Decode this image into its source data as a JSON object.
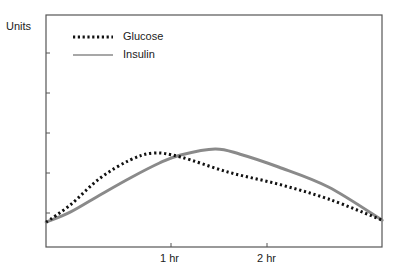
{
  "chart_data": {
    "type": "line",
    "title": "",
    "xlabel": "",
    "ylabel": "Units",
    "x_ticks": [
      {
        "label": "1 hr",
        "value": 1
      },
      {
        "label": "2 hr",
        "value": 2
      }
    ],
    "y_ticks_count": 5,
    "y_tick_labels": [],
    "xlim": [
      -0.3,
      3.2
    ],
    "ylim": [
      0,
      5.8
    ],
    "grid": false,
    "legend_position": "upper-left",
    "series": [
      {
        "name": "Glucose",
        "style": "dotted",
        "color": "#111111",
        "x": [
          -0.3,
          -0.05,
          0.26,
          0.57,
          0.82,
          1.1,
          1.6,
          2.12,
          2.64,
          3.2
        ],
        "y": [
          0.62,
          1.05,
          1.72,
          2.17,
          2.35,
          2.25,
          1.87,
          1.57,
          1.2,
          0.67
        ]
      },
      {
        "name": "Insulin",
        "style": "solid",
        "color": "#8a8a8a",
        "x": [
          -0.3,
          -0.05,
          0.26,
          0.57,
          0.88,
          1.1,
          1.46,
          1.72,
          2.12,
          2.64,
          3.2
        ],
        "y": [
          0.62,
          0.87,
          1.3,
          1.72,
          2.1,
          2.3,
          2.45,
          2.32,
          2.0,
          1.5,
          0.67
        ]
      }
    ]
  },
  "labels": {
    "y_axis": "Units",
    "legend_glucose": "Glucose",
    "legend_insulin": "Insulin",
    "tick_1hr": "1 hr",
    "tick_2hr": "2 hr"
  }
}
